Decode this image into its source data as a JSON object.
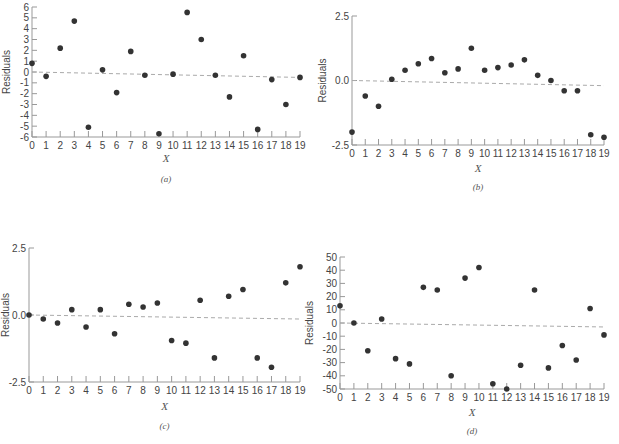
{
  "chart_data": [
    {
      "id": "a",
      "type": "scatter",
      "caption": "(a)",
      "xlabel": "X",
      "ylabel": "Residuals",
      "x": [
        0,
        1,
        2,
        3,
        4,
        5,
        6,
        7,
        8,
        9,
        10,
        11,
        12,
        13,
        14,
        15,
        16,
        17,
        18,
        19
      ],
      "values": [
        0.8,
        -0.4,
        2.2,
        4.7,
        -5.1,
        0.2,
        -1.9,
        1.9,
        -0.3,
        -5.7,
        -0.2,
        5.5,
        3.0,
        -0.3,
        -2.3,
        1.5,
        -5.3,
        -0.7,
        -3.0,
        -0.5
      ],
      "yticks": [
        "6",
        "5",
        "4",
        "3",
        "2",
        "1",
        "0",
        "-1",
        "-2",
        "-3",
        "-4",
        "-5",
        "-6"
      ],
      "ylim": [
        -6,
        6
      ],
      "xlim": [
        0,
        19
      ],
      "reference_line": {
        "style": "dashed",
        "from": [
          0,
          0
        ],
        "to": [
          19,
          -0.5
        ]
      },
      "grid": false,
      "box": {
        "x0": 32,
        "x1": 300,
        "ytop": 7,
        "ybot": 137
      },
      "label_pos": {
        "xlabel_y": 162,
        "cap_y": 182,
        "ylabel_x": 10
      }
    },
    {
      "id": "b",
      "type": "scatter",
      "caption": "(b)",
      "xlabel": "X",
      "ylabel": "Residuals",
      "x": [
        0,
        1,
        2,
        3,
        4,
        5,
        6,
        7,
        8,
        9,
        10,
        11,
        12,
        13,
        14,
        15,
        16,
        17,
        18,
        19
      ],
      "values": [
        -2.0,
        -0.6,
        -1.0,
        0.05,
        0.4,
        0.65,
        0.85,
        0.3,
        0.45,
        1.25,
        0.4,
        0.5,
        0.6,
        0.8,
        0.2,
        0.0,
        -0.4,
        -0.4,
        -2.1,
        -2.2
      ],
      "yticks": [
        "2.5",
        "0.0",
        "-2.5"
      ],
      "ylim": [
        -2.5,
        2.5
      ],
      "xlim": [
        0,
        19
      ],
      "reference_line": {
        "style": "dashed",
        "from": [
          0,
          0
        ],
        "to": [
          19,
          -0.2
        ]
      },
      "grid": false,
      "box": {
        "x0": 352,
        "x1": 604,
        "ytop": 16,
        "ybot": 145
      },
      "label_pos": {
        "xlabel_y": 172,
        "cap_y": 190,
        "ylabel_x": 326
      }
    },
    {
      "id": "c",
      "type": "scatter",
      "caption": "(c)",
      "xlabel": "X",
      "ylabel": "Residuals",
      "x": [
        0,
        1,
        2,
        3,
        4,
        5,
        6,
        7,
        8,
        9,
        10,
        11,
        12,
        13,
        14,
        15,
        16,
        17,
        18,
        19
      ],
      "values": [
        0.0,
        -0.15,
        -0.3,
        0.2,
        -0.45,
        0.2,
        -0.7,
        0.4,
        0.3,
        0.45,
        -0.95,
        -1.05,
        0.55,
        -1.6,
        0.7,
        0.95,
        -1.6,
        -1.95,
        1.2,
        1.8
      ],
      "yticks": [
        "2.5",
        "0.0",
        "-2.5"
      ],
      "ylim": [
        -2.5,
        2.5
      ],
      "xlim": [
        0,
        19
      ],
      "reference_line": {
        "style": "dashed",
        "from": [
          0,
          0
        ],
        "to": [
          19,
          -0.15
        ]
      },
      "grid": false,
      "box": {
        "x0": 29,
        "x1": 300,
        "ytop": 248,
        "ybot": 382
      },
      "label_pos": {
        "xlabel_y": 410,
        "cap_y": 429,
        "ylabel_x": 9
      }
    },
    {
      "id": "d",
      "type": "scatter",
      "caption": "(d)",
      "xlabel": "X",
      "ylabel": "Residuals",
      "x": [
        0,
        1,
        2,
        3,
        4,
        5,
        6,
        7,
        8,
        9,
        10,
        11,
        12,
        13,
        14,
        15,
        16,
        17,
        18,
        19
      ],
      "values": [
        13,
        0,
        -21,
        3,
        -27,
        -31,
        27,
        25,
        -40,
        34,
        42,
        -46,
        -50,
        -32,
        25,
        -34,
        -17,
        -28,
        11,
        -9
      ],
      "yticks": [
        "50",
        "40",
        "30",
        "20",
        "10",
        "0",
        "-10",
        "-20",
        "-30",
        "-40",
        "-50"
      ],
      "ylim": [
        -50,
        50
      ],
      "xlim": [
        0,
        19
      ],
      "reference_line": {
        "style": "dashed",
        "from": [
          0,
          0
        ],
        "to": [
          19,
          -3
        ]
      },
      "grid": false,
      "box": {
        "x0": 340,
        "x1": 604,
        "ytop": 257,
        "ybot": 389
      },
      "label_pos": {
        "xlabel_y": 416,
        "cap_y": 434,
        "ylabel_x": 313
      }
    }
  ]
}
